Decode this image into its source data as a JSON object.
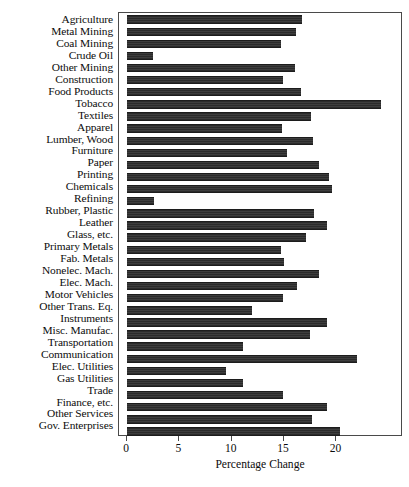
{
  "chart_data": {
    "type": "bar",
    "orientation": "horizontal",
    "title": "",
    "subtitle": "",
    "xlabel": "Percentage Change",
    "ylabel": "",
    "xlim": [
      0,
      25.4
    ],
    "ylim": null,
    "grid": false,
    "legend": null,
    "legend_position": "none",
    "xticks": [
      0,
      5,
      10,
      15,
      20
    ],
    "xtick_labels": [
      "0",
      "5",
      "10",
      "15",
      "20"
    ],
    "categories": [
      "Agriculture",
      "Metal Mining",
      "Coal Mining",
      "Crude Oil",
      "Other Mining",
      "Construction",
      "Food Products",
      "Tobacco",
      "Textiles",
      "Apparel",
      "Lumber, Wood",
      "Furniture",
      "Paper",
      "Printing",
      "Chemicals",
      "Refining",
      "Rubber, Plastic",
      "Leather",
      "Glass, etc.",
      "Primary Metals",
      "Fab. Metals",
      "Nonelec. Mach.",
      "Elec. Mach.",
      "Motor Vehicles",
      "Other Trans. Eq.",
      "Instruments",
      "Misc. Manufac.",
      "Transportation",
      "Communication",
      "Elec. Utilities",
      "Gas Utilities",
      "Trade",
      "Finance, etc.",
      "Other Services",
      "Gov. Enterprises"
    ],
    "values": [
      16.7,
      16.1,
      14.7,
      2.5,
      16.0,
      14.9,
      16.6,
      24.3,
      17.6,
      14.8,
      17.8,
      15.3,
      18.3,
      19.3,
      19.6,
      2.6,
      17.9,
      19.1,
      17.1,
      14.7,
      15.0,
      18.3,
      16.2,
      14.9,
      11.9,
      19.1,
      17.5,
      11.1,
      22.0,
      9.5,
      11.1,
      14.9,
      19.1,
      17.7,
      20.3
    ],
    "bar_color": "#333333",
    "bar_pattern": "horizontal-hatch",
    "frame_color": "#4a4a4a",
    "background_color": "#ffffff",
    "text_color": "#0c0c0c"
  }
}
